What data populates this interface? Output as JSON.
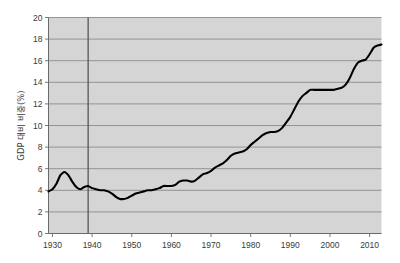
{
  "chart_data": {
    "type": "line",
    "title": "",
    "subtitle": "",
    "xlabel": "",
    "ylabel": "GDP 대비 비중(%)",
    "xlim": [
      1929,
      2013
    ],
    "ylim": [
      0,
      20
    ],
    "xticks": [
      1930,
      1940,
      1950,
      1960,
      1970,
      1980,
      1990,
      2000,
      2010
    ],
    "xtick_labels": [
      "1930",
      "1940",
      "1950",
      "1960",
      "1970",
      "1980",
      "1990",
      "2000",
      "2010"
    ],
    "yticks": [
      0,
      2,
      4,
      6,
      8,
      10,
      12,
      14,
      16,
      18,
      20
    ],
    "ytick_labels": [
      "0",
      "2",
      "4",
      "6",
      "8",
      "10",
      "12",
      "14",
      "16",
      "18",
      "20"
    ],
    "grid": true,
    "grid_axis": "y",
    "legend": false,
    "legend_position": "none",
    "plot_bgcolor": "#d5d5d5",
    "line_color": "#000000",
    "grid_color": "#8c8c8c",
    "annotations": [
      {
        "name": "vertical-reference-line",
        "x": 1939,
        "label": "",
        "color": "#555555"
      }
    ],
    "series": [
      {
        "name": "GDP 대비 비중",
        "x": [
          1929,
          1930,
          1931,
          1932,
          1933,
          1934,
          1935,
          1936,
          1937,
          1938,
          1939,
          1940,
          1941,
          1942,
          1943,
          1944,
          1945,
          1946,
          1947,
          1948,
          1949,
          1950,
          1951,
          1952,
          1953,
          1954,
          1955,
          1956,
          1957,
          1958,
          1959,
          1960,
          1961,
          1962,
          1963,
          1964,
          1965,
          1966,
          1967,
          1968,
          1969,
          1970,
          1971,
          1972,
          1973,
          1974,
          1975,
          1976,
          1977,
          1978,
          1979,
          1980,
          1981,
          1982,
          1983,
          1984,
          1985,
          1986,
          1987,
          1988,
          1989,
          1990,
          1991,
          1992,
          1993,
          1994,
          1995,
          1996,
          1997,
          1998,
          1999,
          2000,
          2001,
          2002,
          2003,
          2004,
          2005,
          2006,
          2007,
          2008,
          2009,
          2010,
          2011,
          2012,
          2013
        ],
        "y": [
          3.9,
          4.1,
          4.6,
          5.4,
          5.7,
          5.4,
          4.8,
          4.3,
          4.1,
          4.3,
          4.4,
          4.2,
          4.1,
          4.0,
          4.0,
          3.9,
          3.7,
          3.4,
          3.2,
          3.2,
          3.3,
          3.5,
          3.7,
          3.8,
          3.9,
          4.0,
          4.0,
          4.1,
          4.2,
          4.4,
          4.4,
          4.4,
          4.5,
          4.8,
          4.9,
          4.9,
          4.8,
          4.9,
          5.2,
          5.5,
          5.6,
          5.8,
          6.1,
          6.3,
          6.5,
          6.8,
          7.2,
          7.4,
          7.5,
          7.6,
          7.8,
          8.2,
          8.5,
          8.8,
          9.1,
          9.3,
          9.4,
          9.4,
          9.5,
          9.8,
          10.3,
          10.8,
          11.5,
          12.2,
          12.7,
          13.0,
          13.3,
          13.3,
          13.3,
          13.3,
          13.3,
          13.3,
          13.3,
          13.4,
          13.5,
          13.8,
          14.4,
          15.2,
          15.8,
          16.0,
          16.1,
          16.6,
          17.2,
          17.4,
          17.5
        ]
      }
    ]
  },
  "axis": {
    "y_title": "GDP 대비 비중(%)"
  }
}
